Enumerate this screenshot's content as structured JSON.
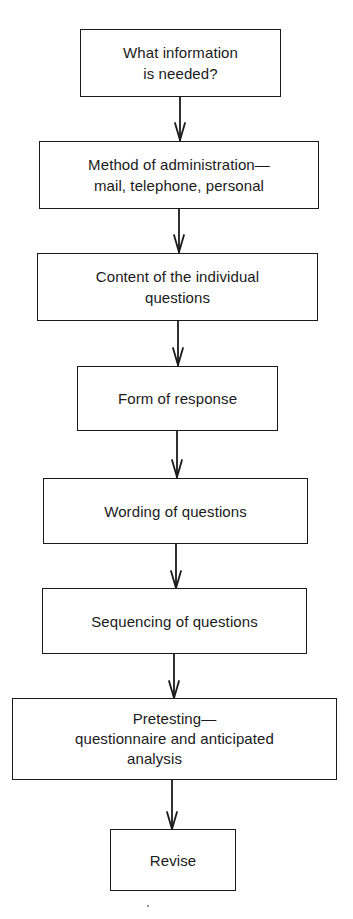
{
  "diagram": {
    "type": "vertical-flowchart",
    "steps": [
      {
        "id": "step-1",
        "lines": [
          "What information",
          "is needed?"
        ]
      },
      {
        "id": "step-2",
        "lines": [
          "Method of administration—",
          "mail, telephone, personal"
        ]
      },
      {
        "id": "step-3",
        "lines": [
          "Content of the individual",
          "questions"
        ]
      },
      {
        "id": "step-4",
        "lines": [
          "Form of response"
        ]
      },
      {
        "id": "step-5",
        "lines": [
          "Wording of questions"
        ]
      },
      {
        "id": "step-6",
        "lines": [
          "Sequencing of questions"
        ]
      },
      {
        "id": "step-7",
        "lines": [
          "Pretesting—",
          "questionnaire and anticipated",
          "analysis"
        ]
      },
      {
        "id": "step-8",
        "lines": [
          "Revise"
        ]
      }
    ],
    "connectors": [
      {
        "from": "step-1",
        "to": "step-2",
        "icon": "arrow-down-icon"
      },
      {
        "from": "step-2",
        "to": "step-3",
        "icon": "arrow-down-icon"
      },
      {
        "from": "step-3",
        "to": "step-4",
        "icon": "arrow-down-icon"
      },
      {
        "from": "step-4",
        "to": "step-5",
        "icon": "arrow-down-icon"
      },
      {
        "from": "step-5",
        "to": "step-6",
        "icon": "arrow-down-icon"
      },
      {
        "from": "step-6",
        "to": "step-7",
        "icon": "arrow-down-icon"
      },
      {
        "from": "step-7",
        "to": "step-8",
        "icon": "arrow-down-icon"
      }
    ],
    "colors": {
      "stroke": "#1a1a1a",
      "background": "#ffffff"
    }
  }
}
